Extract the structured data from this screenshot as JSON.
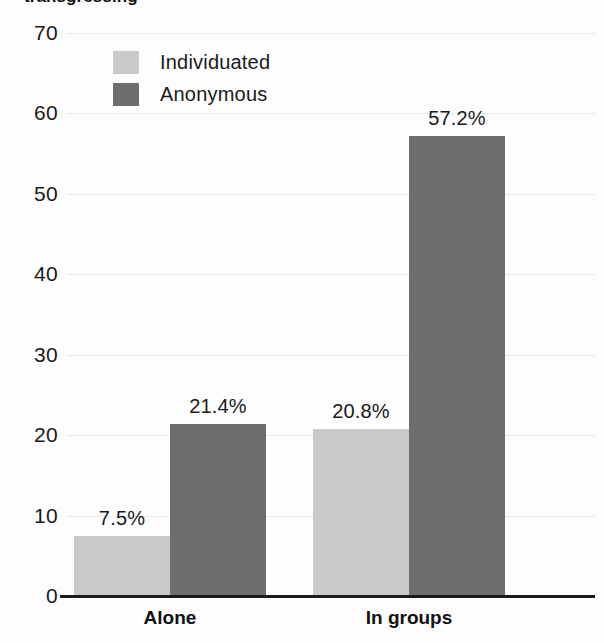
{
  "chart_data": {
    "type": "bar",
    "title": "transgressing",
    "xlabel": "",
    "ylabel": "",
    "ylim": [
      0,
      70
    ],
    "ytick_step": 10,
    "yticks": [
      70,
      60,
      50,
      40,
      30,
      20,
      10,
      0
    ],
    "grid": true,
    "legend_position": "top-left-inside",
    "categories": [
      "Alone",
      "In groups"
    ],
    "series": [
      {
        "name": "Individuated",
        "color": "#c9c9c9",
        "values": [
          7.5,
          20.8
        ],
        "labels": [
          "7.5%",
          "20.8%"
        ]
      },
      {
        "name": "Anonymous",
        "color": "#6e6e6e",
        "values": [
          21.4,
          57.2
        ],
        "labels": [
          "21.4%",
          "57.2%"
        ]
      }
    ]
  },
  "colors": {
    "background": "#fdfdfd",
    "axis": "#1a1a1a",
    "gridline": "#ebebeb",
    "individuated": "#c9c9c9",
    "anonymous": "#6e6e6e",
    "text": "#1a1a1a"
  }
}
